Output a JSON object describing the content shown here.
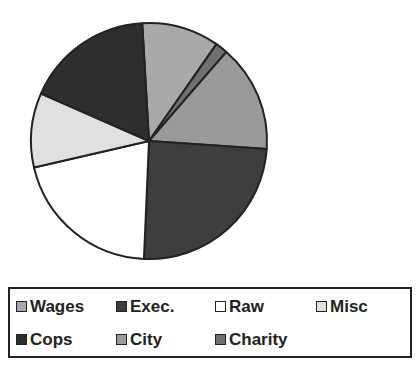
{
  "chart_data": {
    "type": "pie",
    "title": "",
    "start_angle_deg": -3.3,
    "direction": "clockwise",
    "categories": [
      "Wages",
      "Charity",
      "City",
      "Exec.",
      "Raw",
      "Misc",
      "Cops"
    ],
    "values": [
      10.6,
      1.7,
      14.7,
      24.6,
      20.7,
      10.2,
      17.5
    ],
    "unit": "percent (estimated)",
    "colors": {
      "Wages": "#a9a9a9",
      "Charity": "#707070",
      "City": "#9a9a9a",
      "Exec.": "#3e3e3e",
      "Raw": "#ffffff",
      "Misc": "#e0e0e0",
      "Cops": "#2e2e2e"
    },
    "legend_position": "bottom",
    "legend_entries": [
      "Wages",
      "Exec.",
      "Raw",
      "Misc",
      "Cops",
      "City",
      "Charity"
    ]
  },
  "legend": {
    "items": [
      {
        "label": "Wages",
        "color": "#a9a9a9"
      },
      {
        "label": "Exec.",
        "color": "#3e3e3e"
      },
      {
        "label": "Raw",
        "color": "#ffffff"
      },
      {
        "label": "Misc",
        "color": "#e0e0e0"
      },
      {
        "label": "Cops",
        "color": "#2e2e2e"
      },
      {
        "label": "City",
        "color": "#9a9a9a"
      },
      {
        "label": "Charity",
        "color": "#707070"
      }
    ]
  }
}
